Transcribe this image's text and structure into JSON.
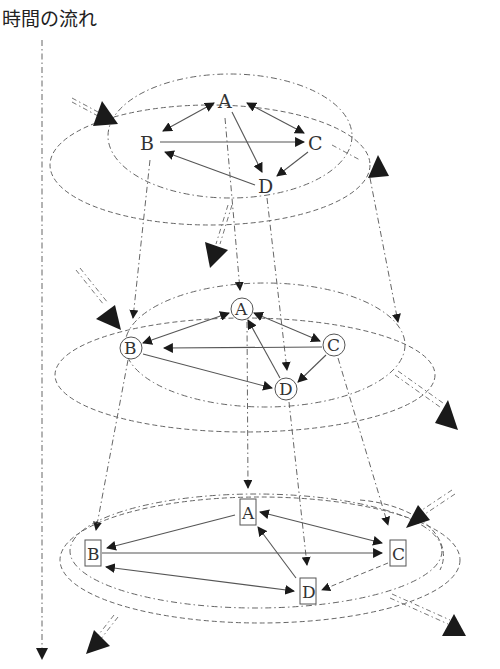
{
  "title": "時間の流れ",
  "diagram": {
    "type": "layered-network-evolution",
    "time_axis": {
      "label": "時間の流れ",
      "direction": "down"
    },
    "layers": [
      {
        "id": "layer-1",
        "node_style": "plain",
        "nodes": [
          {
            "id": "A",
            "label": "A"
          },
          {
            "id": "B",
            "label": "B"
          },
          {
            "id": "C",
            "label": "C"
          },
          {
            "id": "D",
            "label": "D"
          }
        ],
        "edges": [
          {
            "from": "A",
            "to": "B",
            "bidirectional": true
          },
          {
            "from": "A",
            "to": "C",
            "bidirectional": true
          },
          {
            "from": "B",
            "to": "C"
          },
          {
            "from": "A",
            "to": "D"
          },
          {
            "from": "C",
            "to": "D"
          },
          {
            "from": "D",
            "to": "B"
          }
        ]
      },
      {
        "id": "layer-2",
        "node_style": "circle",
        "nodes": [
          {
            "id": "A",
            "label": "A"
          },
          {
            "id": "B",
            "label": "B"
          },
          {
            "id": "C",
            "label": "C"
          },
          {
            "id": "D",
            "label": "D"
          }
        ],
        "edges": [
          {
            "from": "A",
            "to": "B",
            "bidirectional": true
          },
          {
            "from": "A",
            "to": "C",
            "bidirectional": true
          },
          {
            "from": "C",
            "to": "B"
          },
          {
            "from": "B",
            "to": "D"
          },
          {
            "from": "C",
            "to": "D"
          },
          {
            "from": "D",
            "to": "A"
          }
        ]
      },
      {
        "id": "layer-3",
        "node_style": "box",
        "nodes": [
          {
            "id": "A",
            "label": "A"
          },
          {
            "id": "B",
            "label": "B"
          },
          {
            "id": "C",
            "label": "C"
          },
          {
            "id": "D",
            "label": "D"
          }
        ],
        "edges": [
          {
            "from": "A",
            "to": "B"
          },
          {
            "from": "A",
            "to": "C",
            "bidirectional": true
          },
          {
            "from": "B",
            "to": "C"
          },
          {
            "from": "B",
            "to": "D",
            "bidirectional": true
          },
          {
            "from": "D",
            "to": "A"
          },
          {
            "from": "C",
            "to": "D",
            "style": "dashed"
          }
        ]
      }
    ],
    "inter_layer_links": [
      {
        "from": "layer-1.A",
        "to": "layer-2.A"
      },
      {
        "from": "layer-1.B",
        "to": "layer-2.B"
      },
      {
        "from": "layer-1.D",
        "to": "layer-2.D"
      },
      {
        "from": "layer-2.A",
        "to": "layer-3.A"
      },
      {
        "from": "layer-2.B",
        "to": "layer-3.B"
      },
      {
        "from": "layer-2.D",
        "to": "layer-3.D"
      },
      {
        "from": "layer-2.C",
        "to": "layer-3.C"
      }
    ],
    "external_flows": "large black arrowheads with double dash-dot lines entering and leaving each layer's boundary"
  }
}
